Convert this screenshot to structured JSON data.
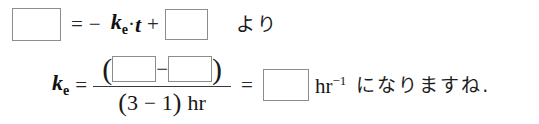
{
  "worksheet": {
    "language": "ja",
    "background_color": "#ffffff",
    "text_color": "#1a1a1a",
    "blank_border_color": "#8d8d8d",
    "blank_fill_color": "#ffffff"
  },
  "line1": {
    "blank_left": "",
    "equals": "=",
    "minus": "−",
    "variable_k": "k",
    "variable_k_subscript": "e",
    "multiply_dot": "·",
    "variable_t": "t",
    "plus": "+",
    "blank_right": "",
    "trailing_japanese": "より"
  },
  "line2": {
    "variable_k": "k",
    "variable_k_subscript": "e",
    "equals_first": "=",
    "numerator": {
      "open_paren": "(",
      "blank_first": "",
      "minus": "−",
      "blank_second": "",
      "close_paren": ")"
    },
    "denominator": {
      "open_paren": "(",
      "value_a": "3",
      "minus": "−",
      "value_b": "1",
      "close_paren": ")",
      "unit": "hr"
    },
    "equals_second": "=",
    "blank_answer": "",
    "unit_base": "hr",
    "unit_exponent": "−1",
    "trailing_japanese": "になりますね."
  },
  "reading": {
    "equation_line1": "□ = − kₑ·t + □  より",
    "equation_line2": "kₑ = (□ − □) / (3 − 1) hr = □ hr⁻¹ になりますね."
  }
}
